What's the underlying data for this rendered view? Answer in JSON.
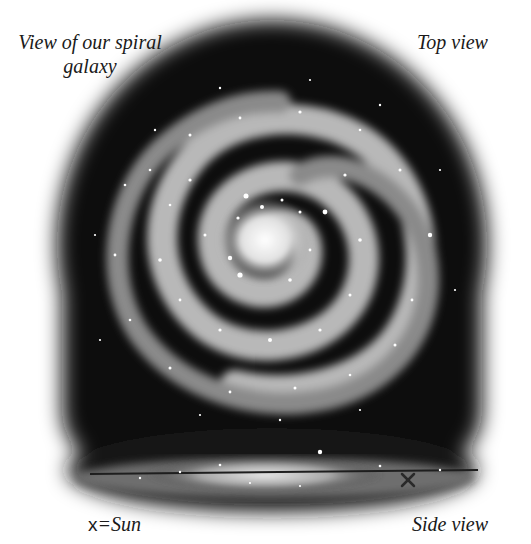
{
  "figure": {
    "title": "View of our spiral galaxy",
    "title_line1": "View of our spiral",
    "title_line2": "galaxy",
    "top_view_label": "Top view",
    "side_view_label": "Side view",
    "legend": {
      "symbol": "x",
      "equals": "=",
      "meaning": "Sun"
    }
  },
  "colors": {
    "background": "#ffffff",
    "space": "#0a0a0a",
    "arm": "#bdbdbd",
    "core": "#f2f2f2",
    "text": "#1a1a1a"
  }
}
